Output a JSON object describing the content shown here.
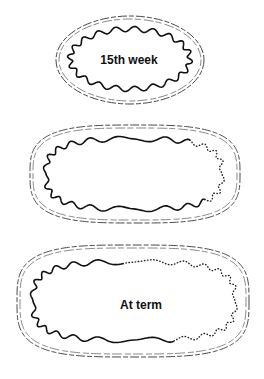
{
  "figure": {
    "stages": [
      {
        "id": "stage-1",
        "label": "15th week",
        "inner_line": "solid wavy all around"
      },
      {
        "id": "stage-2",
        "label": "",
        "inner_line": "solid wavy on left, dotted on right"
      },
      {
        "id": "stage-3",
        "label": "At term",
        "inner_line": "solid wavy on left with intermittent segments, mostly dotted on right"
      }
    ]
  }
}
